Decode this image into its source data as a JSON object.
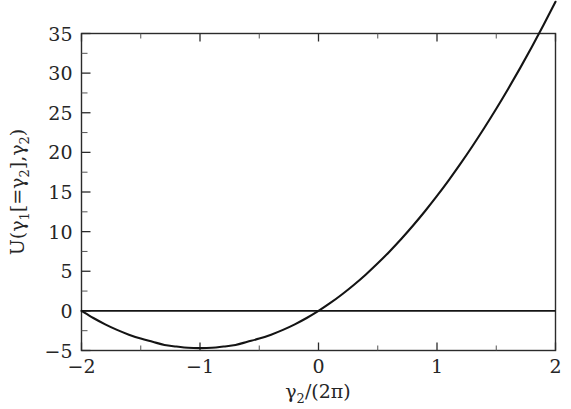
{
  "chart_data": {
    "type": "line",
    "title": "",
    "subtitle": "",
    "xlabel": "γ₂/(2π)",
    "ylabel": "U(γ₁[=γ₂],γ₂)",
    "xlim": [
      -2,
      2
    ],
    "ylim": [
      -5,
      35
    ],
    "grid": false,
    "legend": null,
    "x_ticks_major": [
      -2,
      -1,
      0,
      1,
      2
    ],
    "x_tick_labels": [
      "−2",
      "−1",
      "0",
      "1",
      "2"
    ],
    "x_ticks_minor": [
      -1.5,
      -0.5,
      0.5,
      1.5
    ],
    "y_ticks_major": [
      -5,
      0,
      5,
      10,
      15,
      20,
      25,
      30,
      35
    ],
    "y_tick_labels": [
      "−5",
      "0",
      "5",
      "10",
      "15",
      "20",
      "25",
      "30",
      "35"
    ],
    "y_ticks_minor": [
      -2.5,
      2.5,
      7.5,
      12.5,
      17.5,
      22.5,
      27.5,
      32.5
    ],
    "series": [
      {
        "name": "U(γ₂)",
        "type": "line",
        "color": "#141414",
        "x": [
          -2.0,
          -1.9,
          -1.8,
          -1.7,
          -1.6,
          -1.5,
          -1.4,
          -1.3,
          -1.2,
          -1.1,
          -1.0,
          -0.9,
          -0.8,
          -0.7,
          -0.6,
          -0.5,
          -0.4,
          -0.3,
          -0.2,
          -0.1,
          0.0,
          0.1,
          0.2,
          0.3,
          0.4,
          0.5,
          0.6,
          0.7,
          0.8,
          0.9,
          1.0,
          1.1,
          1.2,
          1.3,
          1.4,
          1.5,
          1.6,
          1.7,
          1.8,
          1.9,
          2.0
        ],
        "y": [
          0.0,
          -0.9,
          -1.7,
          -2.4,
          -3.0,
          -3.5,
          -3.9,
          -4.3,
          -4.5,
          -4.66,
          -4.7,
          -4.66,
          -4.5,
          -4.3,
          -3.9,
          -3.5,
          -3.0,
          -2.4,
          -1.7,
          -0.9,
          0.0,
          1.0,
          2.1,
          3.3,
          4.6,
          6.0,
          7.5,
          9.1,
          10.8,
          12.6,
          14.5,
          16.5,
          18.6,
          20.8,
          23.1,
          25.5,
          28.0,
          30.6,
          33.3,
          36.1,
          39.0
        ]
      },
      {
        "name": "zero-baseline",
        "type": "line",
        "color": "#141414",
        "x": [
          -2.0,
          2.0
        ],
        "y": [
          0.0,
          0.0
        ]
      }
    ],
    "annotations": [
      {
        "text": "minimum",
        "x": -1.0,
        "y": -4.7
      },
      {
        "text": "zero-crossing",
        "x": -2.0,
        "y": 0.0
      },
      {
        "text": "zero-crossing",
        "x": 0.0,
        "y": 0.0
      }
    ]
  },
  "axes": {
    "x_title": "γ₂/(2π)",
    "y_title_parts": {
      "u": "U",
      "open": "(",
      "g1": "γ",
      "g1_sub": "1",
      "bracket_open": "[",
      "eq": "=",
      "g2a": "γ",
      "g2a_sub": "2",
      "bracket_close": "]",
      "comma": ",",
      "g2b": "γ",
      "g2b_sub": "2",
      "close": ")"
    },
    "x_title_parts": {
      "g2": "γ",
      "g2_sub": "2",
      "slash": "/",
      "open": "(",
      "two": "2",
      "pi": "π",
      "close": ")"
    }
  },
  "style": {
    "curve_color": "#141414",
    "frame_color": "#2b2b2b",
    "text_color": "#262626",
    "background": "#ffffff"
  }
}
